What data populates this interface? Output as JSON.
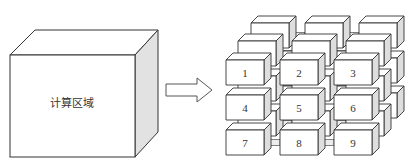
{
  "left_block": {
    "label": "计算区域"
  },
  "arrow": {
    "direction": "right"
  },
  "grid": {
    "rows": 3,
    "cols": 3,
    "layers": 3,
    "front_labels": [
      "1",
      "2",
      "3",
      "4",
      "5",
      "6",
      "7",
      "8",
      "9"
    ]
  },
  "colors": {
    "stroke": "#333333",
    "face": "#ffffff",
    "side": "#dedede",
    "top": "#ffffff"
  }
}
